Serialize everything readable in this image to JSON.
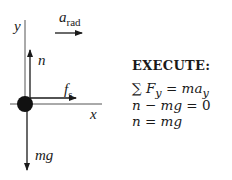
{
  "diagram": {
    "type": "free-body-diagram",
    "axes": {
      "y_label": "y",
      "x_label": "x"
    },
    "acceleration": {
      "symbol": "a",
      "subscript": "rad",
      "direction": "right"
    },
    "forces": [
      {
        "symbol": "n",
        "subscript": "",
        "direction": "up"
      },
      {
        "symbol": "f",
        "subscript": "s",
        "direction": "right"
      },
      {
        "symbol": "mg",
        "subscript": "",
        "direction": "down"
      }
    ],
    "colors": {
      "ink": "#1a1a1a",
      "background": "#ffffff"
    }
  },
  "solution": {
    "heading": "EXECUTE:",
    "equations": [
      "∑ F_y = m a_y",
      "n − mg = 0",
      "n = mg"
    ],
    "eq1": {
      "sum": "∑",
      "F": "F",
      "F_sub": "y",
      "rhs_m": "ma",
      "rhs_sub": "y"
    },
    "eq2": {
      "n": "n",
      "op": " − ",
      "mg": "mg",
      "rest": " = 0"
    },
    "eq3": {
      "n": "n",
      "rest": " = ",
      "mg": "mg"
    }
  }
}
